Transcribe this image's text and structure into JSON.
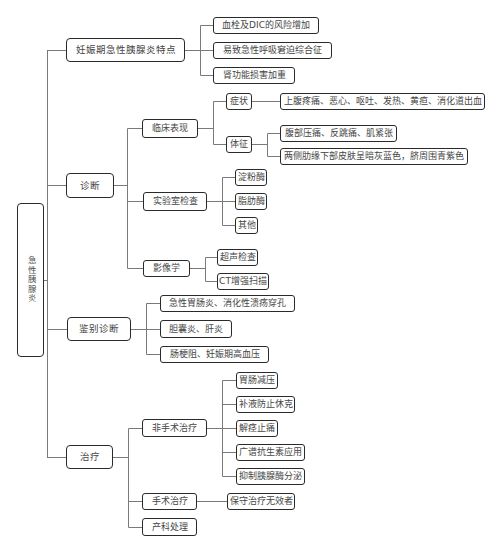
{
  "diagram": {
    "type": "mind-map",
    "colors": {
      "node_border": "#2a2a2a",
      "connector": "#7a7a7a",
      "text": "#454545",
      "background": "#ffffff"
    }
  },
  "root": {
    "label": "急性胰腺炎"
  },
  "branches": [
    {
      "label": "妊娠期急性胰腺炎特点",
      "children": [
        {
          "label": "血栓及DIC的风险增加"
        },
        {
          "label": "易致急性呼吸窘迫综合征"
        },
        {
          "label": "肾功能损害加重"
        }
      ]
    },
    {
      "label": "诊断",
      "children": [
        {
          "label": "临床表现",
          "children": [
            {
              "label": "症状",
              "children": [
                {
                  "label": "上腹疼痛、恶心、呕吐、发热、黄疸、消化道出血"
                }
              ]
            },
            {
              "label": "体征",
              "children": [
                {
                  "label": "腹部压痛、反跳痛、肌紧张"
                },
                {
                  "label": "两侧肋缘下部皮肤呈暗灰蓝色，脐周围青紫色"
                }
              ]
            }
          ]
        },
        {
          "label": "实验室检查",
          "children": [
            {
              "label": "淀粉酶"
            },
            {
              "label": "脂肪酶"
            },
            {
              "label": "其他"
            }
          ]
        },
        {
          "label": "影像学",
          "children": [
            {
              "label": "超声检查"
            },
            {
              "label": "CT增强扫描"
            }
          ]
        }
      ]
    },
    {
      "label": "鉴别诊断",
      "children": [
        {
          "label": "急性胃肠炎、消化性溃疡穿孔"
        },
        {
          "label": "胆囊炎、肝炎"
        },
        {
          "label": "肠梗阻、妊娠期高血压"
        }
      ]
    },
    {
      "label": "治疗",
      "children": [
        {
          "label": "非手术治疗",
          "children": [
            {
              "label": "胃肠减压"
            },
            {
              "label": "补液防止休克"
            },
            {
              "label": "解痉止痛"
            },
            {
              "label": "广谱抗生素应用"
            },
            {
              "label": "抑制胰腺酶分泌"
            }
          ]
        },
        {
          "label": "手术治疗",
          "children": [
            {
              "label": "保守治疗无效者"
            }
          ]
        },
        {
          "label": "产科处理"
        }
      ]
    }
  ]
}
